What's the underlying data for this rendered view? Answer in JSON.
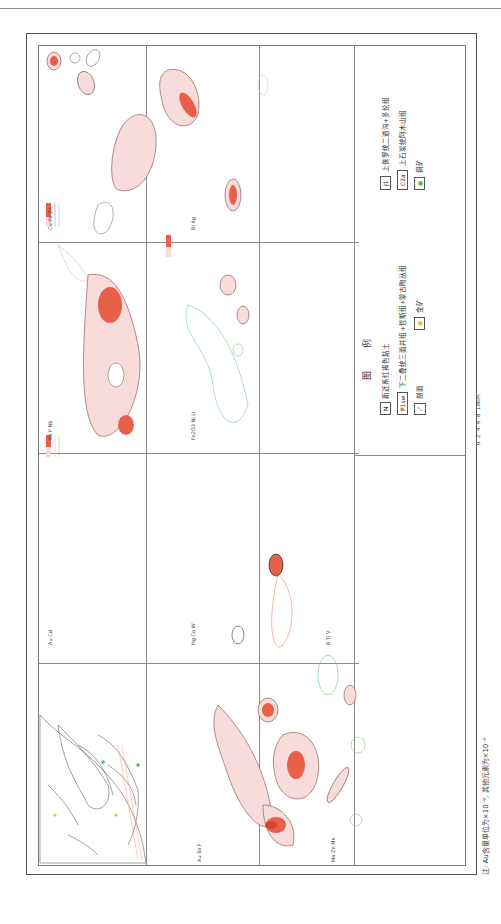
{
  "figure": {
    "orientation": "rotated 90° counter-clockwise",
    "note": "注: Au含量单位为×10⁻⁹, 其他元素为×10⁻⁶",
    "scale_bar": {
      "ticks": [
        "0",
        "2",
        "4",
        "6",
        "8",
        "10km"
      ]
    }
  },
  "panels": [
    {
      "id": "geology",
      "kind": "geologic-map",
      "labels": [
        "鹤仁马岩",
        "巴浪撒力铁矿",
        "古拉那钨锡矿",
        "沙特",
        "干沟",
        "N",
        "Cd",
        "J1",
        "P1sw"
      ]
    },
    {
      "id": "au-ag-as",
      "legend": {
        "elements": [
          "Au",
          "Sn",
          "F"
        ],
        "levels": [
          "20",
          "50",
          "100"
        ]
      }
    },
    {
      "id": "mo-zn-mn",
      "legend": {
        "elements": [
          "Mo",
          "Zn",
          "Mn"
        ],
        "levels": [
          "1",
          "2"
        ]
      }
    },
    {
      "id": "au-cd",
      "legend": {
        "elements": [
          "Au",
          "Cd"
        ],
        "levels": [
          "5",
          "10",
          "20"
        ]
      }
    },
    {
      "id": "hg-co-w",
      "legend": {
        "elements": [
          "Hg",
          "Co",
          "W"
        ],
        "levels": [
          "15",
          "30"
        ]
      }
    },
    {
      "id": "b-ti-v",
      "legend": {
        "elements": [
          "B",
          "Ti",
          "V"
        ],
        "levels": [
          "30",
          "60"
        ]
      }
    },
    {
      "id": "bi-ag",
      "legend": {
        "elements": [
          "Bi",
          "Ag"
        ],
        "levels": [
          "0.5",
          "1",
          "2"
        ]
      }
    },
    {
      "id": "fe-ni-li",
      "legend": {
        "elements": [
          "Fe2O3",
          "Ni",
          "Li"
        ],
        "levels": [
          "5",
          "10"
        ]
      }
    },
    {
      "id": "cu-pb-zn",
      "legend": {
        "elements": [
          "Cu",
          "Pb",
          "Zn"
        ],
        "levels": [
          "30",
          "50"
        ]
      }
    },
    {
      "id": "sb-p-nb",
      "legend": {
        "elements": [
          "Sb",
          "P",
          "Nb"
        ],
        "levels": [
          "1",
          "2"
        ]
      }
    }
  ],
  "legend": {
    "title": "图    例",
    "items": [
      {
        "symbol": "N",
        "label": "新近系红褐色黏土"
      },
      {
        "symbol": "P1sw",
        "label": "下二叠统三面井组+哲斯组+蒙古陶丛组"
      },
      {
        "symbol": "profile",
        "label": "剖面"
      },
      {
        "symbol": "gold-dot",
        "label": "金矿"
      },
      {
        "symbol": "J1",
        "label": "上侏罗统二道沟+多伦组"
      },
      {
        "symbol": "C2a",
        "label": "上石炭统阿木山组"
      },
      {
        "symbol": "copper-dot",
        "label": "铜矿"
      }
    ]
  },
  "colors": {
    "anomaly_high": "#e8604a",
    "anomaly_mid": "#f2a493",
    "anomaly_low": "#f8dcdc",
    "green_line": "#7fc97f",
    "blue_line": "#9db4e8",
    "gold": "#e8c23a",
    "copper": "#5db85d"
  }
}
